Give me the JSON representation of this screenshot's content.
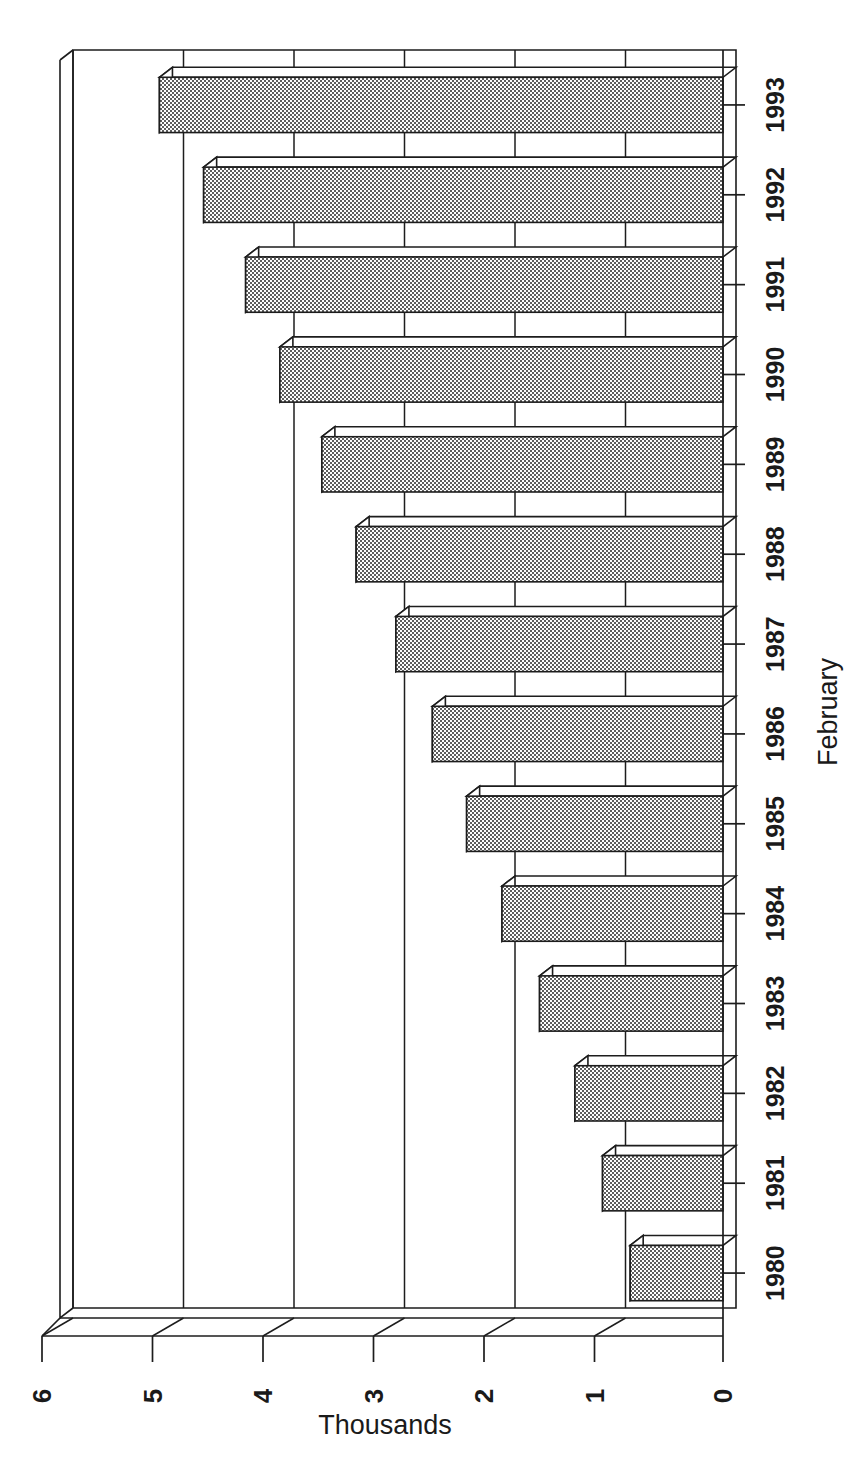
{
  "chart_data": {
    "type": "bar",
    "orientation": "horizontal",
    "style": "3d-bar",
    "title": "",
    "subtitle": "",
    "xlabel": "Thousands",
    "ylabel": "February",
    "categories": [
      "1980",
      "1981",
      "1982",
      "1983",
      "1984",
      "1985",
      "1986",
      "1987",
      "1988",
      "1989",
      "1990",
      "1991",
      "1992",
      "1993"
    ],
    "values": [
      0.84,
      1.09,
      1.34,
      1.66,
      2.0,
      2.32,
      2.63,
      2.96,
      3.32,
      3.63,
      4.01,
      4.32,
      4.7,
      5.1
    ],
    "series": [
      {
        "name": "February",
        "values": [
          0.84,
          1.09,
          1.34,
          1.66,
          2.0,
          2.32,
          2.63,
          2.96,
          3.32,
          3.63,
          4.01,
          4.32,
          4.7,
          5.1
        ]
      }
    ],
    "value_axis": {
      "label": "Thousands",
      "ticks": [
        0,
        1,
        2,
        3,
        4,
        5,
        6
      ],
      "tick_labels": [
        "0",
        "1",
        "2",
        "3",
        "4",
        "5",
        "6"
      ],
      "min": 0,
      "max": 6,
      "direction": "right-to-left",
      "rotated_labels": true
    },
    "category_axis": {
      "label": "February",
      "tick_labels": [
        "1980",
        "1981",
        "1982",
        "1983",
        "1984",
        "1985",
        "1986",
        "1987",
        "1988",
        "1989",
        "1990",
        "1991",
        "1992",
        "1993"
      ],
      "rotated_labels": true
    },
    "grid": {
      "vertical_gridlines": true,
      "horizontal_gridlines": false
    },
    "legend": {
      "visible": false,
      "position": "none",
      "entries": []
    },
    "annotations": [],
    "colors": {
      "bar_fill": "#9a9a9a",
      "bar_outline": "#1d1d1d",
      "bar_top_face": "#ffffff",
      "bar_side_face": "#ffffff",
      "background": "#ffffff",
      "gridline": "#1d1d1d",
      "text": "#1a1a1a"
    }
  },
  "axis_titles": {
    "value": "Thousands",
    "category": "February"
  }
}
